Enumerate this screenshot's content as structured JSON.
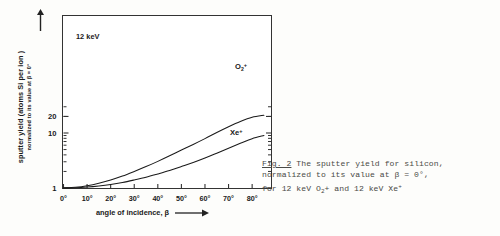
{
  "figure": {
    "annotation": "12 keV",
    "caption": {
      "figure_number": "Fig. 2",
      "line1_rest": " The sputter yield for silicon,",
      "line2": "normalized to its value at β = 0°,",
      "line3_prefix": "for 12 keV O",
      "line3_sub": "2",
      "line3_mid": "+ and 12 keV Xe",
      "line3_sup": "+"
    }
  },
  "chart_data": {
    "type": "line",
    "title": "",
    "xlabel": "angle of incidence, β",
    "ylabel": "sputter yield (atoms Si per ion )",
    "ylabel_sub": "normalized to its value at β = 0°",
    "xlabel_arrow": "⟶",
    "yscale": "log",
    "xscale": "linear",
    "xlim": [
      0,
      88
    ],
    "ylim": [
      1,
      30
    ],
    "grid": false,
    "legend": "inline-labels",
    "xticks": [
      0,
      10,
      20,
      30,
      40,
      50,
      60,
      70,
      80
    ],
    "xtick_labels": [
      "0°",
      "10°",
      "20°",
      "30°",
      "40°",
      "50°",
      "60°",
      "70°",
      "80°"
    ],
    "yticks": [
      1,
      10,
      20
    ],
    "ytick_labels": [
      "1",
      "10",
      "20"
    ],
    "y_minor_ticks": [
      2,
      3,
      4,
      5,
      6,
      7,
      8,
      9,
      20,
      30
    ],
    "series": [
      {
        "name": "O2+",
        "label_html": "O<sub>2</sub><sup>+</sup>",
        "x": [
          0,
          5,
          10,
          15,
          20,
          25,
          30,
          35,
          40,
          45,
          50,
          55,
          60,
          65,
          70,
          75,
          80,
          85
        ],
        "y": [
          1.0,
          1.03,
          1.1,
          1.22,
          1.4,
          1.65,
          2.0,
          2.45,
          3.05,
          3.85,
          4.9,
          6.2,
          7.9,
          10.2,
          13.0,
          16.2,
          19.3,
          21.0
        ]
      },
      {
        "name": "Xe+",
        "label_html": "Xe<sup>+</sup>",
        "x": [
          0,
          5,
          10,
          15,
          20,
          25,
          30,
          35,
          40,
          45,
          50,
          55,
          60,
          65,
          70,
          75,
          80,
          85
        ],
        "y": [
          1.0,
          1.01,
          1.04,
          1.09,
          1.16,
          1.26,
          1.4,
          1.57,
          1.8,
          2.08,
          2.45,
          2.9,
          3.5,
          4.3,
          5.3,
          6.5,
          7.9,
          9.0
        ]
      }
    ]
  }
}
